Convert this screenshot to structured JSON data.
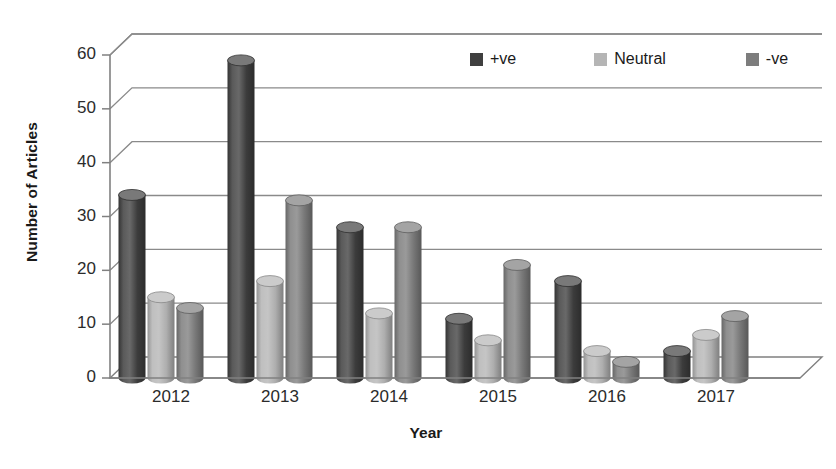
{
  "chart_data": {
    "type": "bar",
    "title": "",
    "subtitle": "",
    "xlabel": "Year",
    "ylabel": "Number of Articles",
    "categories": [
      "2012",
      "2013",
      "2014",
      "2015",
      "2016",
      "2017"
    ],
    "series": [
      {
        "name": "+ve",
        "color": "#3f3f3f",
        "values": [
          34,
          59,
          28,
          11,
          18,
          5
        ]
      },
      {
        "name": "Neutral",
        "color": "#b5b5b5",
        "values": [
          15,
          18,
          12,
          7,
          5,
          8
        ]
      },
      {
        "name": "-ve",
        "color": "#7d7d7d",
        "values": [
          13,
          33,
          28,
          21,
          3,
          11.5
        ]
      }
    ],
    "ylim": [
      0,
      60
    ],
    "yticks": [
      0,
      10,
      20,
      30,
      40,
      50,
      60
    ],
    "ytick_labels": [
      "0",
      "10",
      "20",
      "30",
      "40",
      "50",
      "60"
    ],
    "grid": true,
    "grid_axis": "y",
    "legend_position": "top-right",
    "style": "3d-cylinder",
    "background": "#ffffff",
    "axis_color": "#808080",
    "grid_color": "#8a8a8a"
  },
  "legend": {
    "items": [
      {
        "label": "+ve",
        "swatch_color": "#3f3f3f"
      },
      {
        "label": "Neutral",
        "swatch_color": "#b5b5b5"
      },
      {
        "label": "-ve",
        "swatch_color": "#7d7d7d"
      }
    ]
  },
  "axes": {
    "y_title": "Number of Articles",
    "x_title": "Year",
    "y_tick_labels": [
      "60",
      "50",
      "40",
      "30",
      "20",
      "10",
      "0"
    ],
    "x_tick_labels": [
      "2012",
      "2013",
      "2014",
      "2015",
      "2016",
      "2017"
    ]
  }
}
